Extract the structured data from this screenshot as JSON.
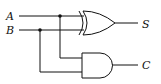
{
  "diagram": {
    "inputs": [
      {
        "label": "A"
      },
      {
        "label": "B"
      }
    ],
    "outputs": [
      {
        "label": "S",
        "gate": "XOR"
      },
      {
        "label": "C",
        "gate": "AND"
      }
    ],
    "gates": [
      "XOR",
      "AND"
    ],
    "colors": {
      "stroke": "#111111",
      "background": "#ffffff"
    }
  }
}
